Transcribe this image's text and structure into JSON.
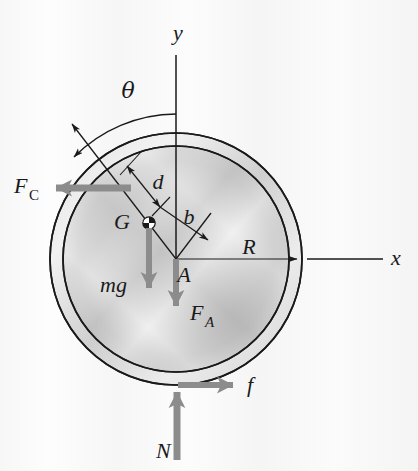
{
  "figure": {
    "type": "free-body-diagram",
    "background_color": "#fbfbfb",
    "outline_color": "#1a1a1a",
    "force_arrow_color": "#8c8c8c",
    "dimension_line_color": "#333333"
  },
  "geometry": {
    "center_label": "A",
    "center_x": 176,
    "center_y": 259,
    "outer_radius": 126,
    "inner_radius": 113,
    "cg_x": 149,
    "cg_y": 223
  },
  "axes": {
    "y_label": "y",
    "x_label": "x",
    "y_label_x": 178,
    "y_label_y": 40,
    "x_label_x": 396,
    "x_label_y": 258
  },
  "angle": {
    "label": "θ",
    "label_x": 128,
    "label_y": 98,
    "description": "angle from y-axis to the line through A and G extended"
  },
  "forces": [
    {
      "name": "F_C",
      "base": "F",
      "sub": "C",
      "label_x": 14,
      "label_y": 193,
      "direction": "left",
      "description": "applied cord force to the left"
    },
    {
      "name": "mg",
      "base": "mg",
      "sub": "",
      "label_x": 100,
      "label_y": 292,
      "direction": "down",
      "description": "weight acting at center of gravity G"
    },
    {
      "name": "F_A",
      "base": "F",
      "sub": "A",
      "label_x": 190,
      "label_y": 320,
      "direction": "down",
      "description": "force at center A pointing down"
    },
    {
      "name": "f",
      "base": "f",
      "sub": "",
      "label_x": 247,
      "label_y": 392,
      "direction": "right",
      "description": "friction force at the ground contact"
    },
    {
      "name": "N",
      "base": "N",
      "sub": "",
      "label_x": 156,
      "label_y": 458,
      "direction": "up",
      "description": "normal force from the ground"
    }
  ],
  "dimensions": [
    {
      "name": "R",
      "label": "R",
      "label_x": 249,
      "label_y": 254,
      "description": "radius from center A to the outer rim"
    },
    {
      "name": "d",
      "label": "d",
      "label_x": 158,
      "label_y": 189,
      "description": "offset distance measured perpendicular along the inclined line"
    },
    {
      "name": "b",
      "label": "b",
      "label_x": 189,
      "label_y": 224,
      "description": "distance from G-line to center A"
    }
  ],
  "points": [
    {
      "name": "G",
      "label": "G",
      "label_x": 122,
      "label_y": 229,
      "description": "center of gravity marker (quartered circle)"
    },
    {
      "name": "A",
      "label": "A",
      "label_x": 184,
      "label_y": 282,
      "description": "geometric center of the disk"
    }
  ]
}
